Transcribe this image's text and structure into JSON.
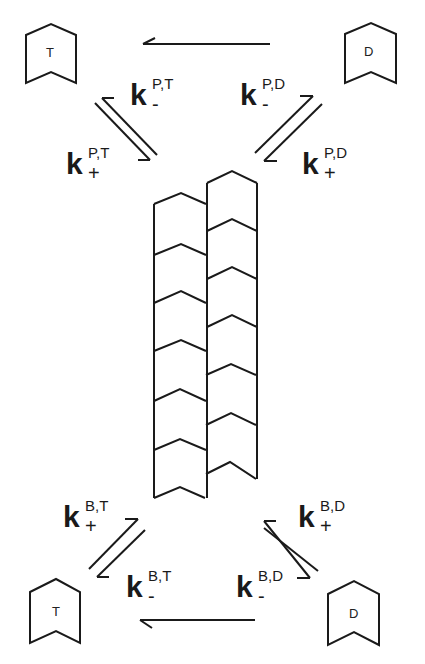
{
  "diagram": {
    "type": "treadmilling-filament-kinetics",
    "colors": {
      "stroke": "#1a1a1a",
      "background": "#ffffff"
    },
    "subunits": {
      "top_left": "T",
      "top_right": "D",
      "bottom_left": "T",
      "bottom_right": "D"
    },
    "rate_constants": {
      "pointed_T_minus": {
        "base": "k",
        "sub": "-",
        "sup": "P,T"
      },
      "pointed_T_plus": {
        "base": "k",
        "sub": "+",
        "sup": "P,T"
      },
      "pointed_D_minus": {
        "base": "k",
        "sub": "-",
        "sup": "P,D"
      },
      "pointed_D_plus": {
        "base": "k",
        "sub": "+",
        "sup": "P,D"
      },
      "barbed_T_plus": {
        "base": "k",
        "sub": "+",
        "sup": "B,T"
      },
      "barbed_T_minus": {
        "base": "k",
        "sub": "-",
        "sup": "B,T"
      },
      "barbed_D_plus": {
        "base": "k",
        "sub": "+",
        "sup": "B,D"
      },
      "barbed_D_minus": {
        "base": "k",
        "sub": "-",
        "sup": "B,D"
      }
    },
    "arrows": [
      {
        "from": "top_right_D",
        "to": "top_left_T",
        "kind": "conversion"
      },
      {
        "from": "bottom_right_D",
        "to": "bottom_left_T",
        "kind": "conversion"
      }
    ],
    "filament": {
      "protofilaments": 2,
      "left_subunits": 6,
      "right_subunits": 6
    }
  }
}
